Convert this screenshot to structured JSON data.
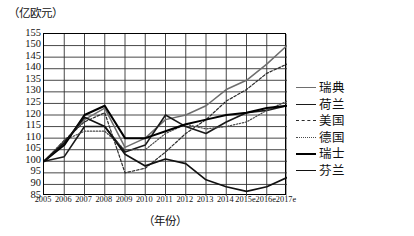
{
  "chart_data": {
    "type": "line",
    "title": "",
    "ylabel": "（亿欧元）",
    "xlabel": "（年份）",
    "ylim": [
      85,
      155
    ],
    "ytick_step": 5,
    "yticks": [
      155,
      150,
      145,
      140,
      135,
      130,
      125,
      120,
      115,
      110,
      105,
      100,
      95,
      90,
      85
    ],
    "grid": true,
    "legend_position": "right",
    "categories": [
      "2005",
      "2006",
      "2007",
      "2008",
      "2009",
      "2010",
      "2011",
      "2012",
      "2013",
      "2014",
      "2015e",
      "2016e",
      "2017e"
    ],
    "series": [
      {
        "name": "瑞典",
        "style": "solid",
        "color": "#6e6e6e",
        "width": 1.5,
        "values": [
          100,
          108,
          118,
          123,
          106,
          110,
          118,
          120,
          124,
          131,
          135,
          142,
          150
        ]
      },
      {
        "name": "荷兰",
        "style": "solid",
        "color": "#1a1a1a",
        "width": 1.6,
        "values": [
          100,
          102,
          115,
          115,
          104,
          107,
          120,
          115,
          112,
          117,
          121,
          122,
          124
        ]
      },
      {
        "name": "美国",
        "style": "dashed",
        "color": "#2b2b2b",
        "width": 1.2,
        "values": [
          100,
          109,
          117,
          121,
          95,
          97,
          104,
          112,
          118,
          126,
          131,
          138,
          142
        ]
      },
      {
        "name": "德国",
        "style": "dotted",
        "color": "#4a4a4a",
        "width": 1.2,
        "values": [
          100,
          109,
          113,
          113,
          105,
          105,
          112,
          116,
          114,
          115,
          117,
          122,
          126
        ]
      },
      {
        "name": "瑞士",
        "style": "solid",
        "color": "#000000",
        "width": 2.0,
        "values": [
          100,
          107,
          120,
          124,
          110,
          110,
          113,
          116,
          118,
          120,
          121,
          123,
          124
        ]
      },
      {
        "name": "芬兰",
        "style": "solid",
        "color": "#111111",
        "width": 1.7,
        "values": [
          100,
          108,
          119,
          115,
          103,
          98,
          101,
          99,
          92,
          89,
          87,
          89,
          93
        ]
      }
    ]
  },
  "legend": {
    "items": [
      {
        "label": "瑞典"
      },
      {
        "label": "荷兰"
      },
      {
        "label": "美国"
      },
      {
        "label": "德国"
      },
      {
        "label": "瑞士"
      },
      {
        "label": "芬兰"
      }
    ]
  }
}
